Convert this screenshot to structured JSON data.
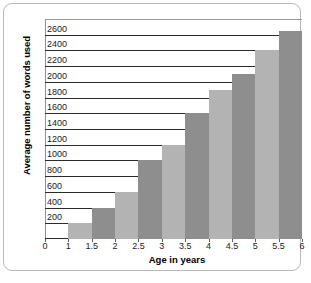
{
  "chart_data": {
    "type": "bar",
    "title": "",
    "xlabel": "Age in years",
    "ylabel": "Average number of words used",
    "categories": [
      "1.5",
      "2",
      "2.5",
      "3",
      "3.5",
      "4",
      "4.5",
      "5",
      "5.5",
      "6"
    ],
    "values": [
      200,
      400,
      600,
      1000,
      1200,
      1600,
      1900,
      2100,
      2400,
      2650
    ],
    "x_tick_labels": [
      "0",
      "1",
      "1.5",
      "2",
      "2.5",
      "3",
      "3.5",
      "4",
      "4.5",
      "5",
      "5.5",
      "6"
    ],
    "y_tick_labels": [
      "200",
      "400",
      "600",
      "800",
      "1000",
      "1200",
      "1400",
      "1600",
      "1800",
      "2000",
      "2200",
      "2400",
      "2600"
    ],
    "y_tick_values": [
      200,
      400,
      600,
      800,
      1000,
      1200,
      1400,
      1600,
      1800,
      2000,
      2200,
      2400,
      2600
    ],
    "ylim": [
      0,
      2800
    ],
    "grid": true,
    "legend": "none",
    "bar_colors": [
      "#b3b3b3",
      "#8e8e8e"
    ],
    "bar_color_light": "#b3b3b3",
    "bar_color_dark": "#8e8e8e",
    "gridline_color": "#2b2b2b",
    "background_color": "#ffffff",
    "frame_color": "#b9b9b9"
  }
}
